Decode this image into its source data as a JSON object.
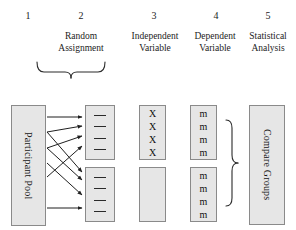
{
  "figure": {
    "background": "#ffffff",
    "box_fill": "#e6e6e6",
    "box_stroke": "#8a8a8a",
    "ink": "#1a1a1a"
  },
  "columns": [
    {
      "number": "1",
      "label": ""
    },
    {
      "number": "2",
      "label": "Random\nAssignment"
    },
    {
      "number": "3",
      "label": "Independent\nVariable"
    },
    {
      "number": "4",
      "label": "Dependent\nVariable"
    },
    {
      "number": "5",
      "label": "Statistical\nAnalysis"
    }
  ],
  "column_labels": {
    "c2_line1": "Random",
    "c2_line2": "Assignment",
    "c3_line1": "Independent",
    "c3_line2": "Variable",
    "c4_line1": "Dependent",
    "c4_line2": "Variable",
    "c5_line1": "Statistical",
    "c5_line2": "Analysis"
  },
  "pool": {
    "label": "Participant Pool"
  },
  "groups": [
    {
      "name": "group-top",
      "members": [
        "—",
        "—",
        "—",
        "—"
      ],
      "count": 4
    },
    {
      "name": "group-bottom",
      "members": [
        "—",
        "—",
        "—",
        "—"
      ],
      "count": 4
    }
  ],
  "independent_variable": [
    {
      "name": "iv-treatment",
      "items": [
        "X",
        "X",
        "X",
        "X"
      ],
      "count": 4
    },
    {
      "name": "iv-control",
      "items": [],
      "count": 0
    }
  ],
  "dependent_variable": [
    {
      "name": "dv-treatment",
      "items": [
        "m",
        "m",
        "m",
        "m"
      ],
      "count": 4
    },
    {
      "name": "dv-control",
      "items": [
        "m",
        "m",
        "m",
        "m"
      ],
      "count": 4
    }
  ],
  "analysis": {
    "label": "Compare Groups"
  },
  "braces": {
    "assignment_brace": "downward-brace",
    "analysis_brace": "rightward-brace"
  },
  "arrows": {
    "count": 8,
    "description": "random assignment arrows from participant pool to two groups"
  }
}
